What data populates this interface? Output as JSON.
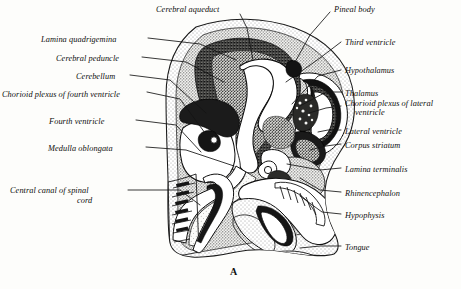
{
  "figure": {
    "caption": "A",
    "ink_color": "#0d0d0d",
    "background_color": "#fdfdfb"
  },
  "labels_left": [
    {
      "text": "Cerebral aqueduct",
      "x": 156,
      "y": 5,
      "align": "left"
    },
    {
      "text": "Lamina quadrigemina",
      "x": 41,
      "y": 35,
      "align": "left"
    },
    {
      "text": "Cerebral peduncle",
      "x": 56,
      "y": 54,
      "align": "left"
    },
    {
      "text": "Cerebellum",
      "x": 76,
      "y": 72,
      "align": "left"
    },
    {
      "text": "Chorioid plexus of fourth ventricle",
      "x": 2,
      "y": 90,
      "align": "left"
    },
    {
      "text": "Fourth ventricle",
      "x": 49,
      "y": 117,
      "align": "left"
    },
    {
      "text": "Medulla oblongata",
      "x": 48,
      "y": 144,
      "align": "left"
    },
    {
      "text": "Central canal of spinal",
      "x": 10,
      "y": 186,
      "align": "left"
    },
    {
      "text": "cord",
      "x": 77,
      "y": 196,
      "align": "left"
    }
  ],
  "labels_right": [
    {
      "text": "Pineal body",
      "x": 334,
      "y": 5
    },
    {
      "text": "Third ventricle",
      "x": 345,
      "y": 38
    },
    {
      "text": "Hypothalamus",
      "x": 345,
      "y": 66
    },
    {
      "text": "Thalamus",
      "x": 345,
      "y": 89
    },
    {
      "text": "Chorioid plexus of lateral",
      "x": 345,
      "y": 99
    },
    {
      "text": "ventricle",
      "x": 355,
      "y": 108
    },
    {
      "text": "Lateral ventricle",
      "x": 345,
      "y": 127
    },
    {
      "text": "Corpus striatum",
      "x": 345,
      "y": 141
    },
    {
      "text": "Lamina terminalis",
      "x": 345,
      "y": 165
    },
    {
      "text": "Rhinencephalon",
      "x": 345,
      "y": 189
    },
    {
      "text": "Hypophysis",
      "x": 345,
      "y": 211
    },
    {
      "text": "Tongue",
      "x": 345,
      "y": 243
    }
  ],
  "caption_position": {
    "x": 230,
    "y": 266
  }
}
